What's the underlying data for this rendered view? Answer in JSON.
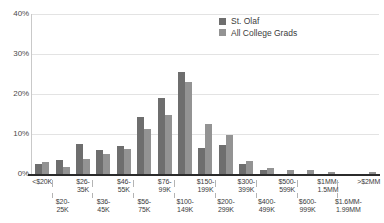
{
  "chart_data": {
    "type": "bar",
    "title": "",
    "subtitle": "",
    "xlabel": "",
    "ylabel": "",
    "ylim": [
      0,
      40
    ],
    "yunit": "%",
    "grid": true,
    "legend_position": "top-right",
    "ytick_labels": [
      "40%",
      "30%",
      "20%",
      "10%",
      "0%"
    ],
    "ytick_values": [
      40,
      30,
      20,
      10,
      0
    ],
    "categories": [
      "<$20K",
      "$20-\n25K",
      "$26-\n35K",
      "$36-\n45K",
      "$46-\n55K",
      "$56-\n75K",
      "$76-\n99K",
      "$100-\n149K",
      "$150-\n199K",
      "$200-\n299K",
      "$300-\n399K",
      "$400-\n499K",
      "$500-\n599K",
      "$600-\n999K",
      "$1MM-\n1.5MM",
      "$1.6MM-\n1.99MM",
      ">$2MM"
    ],
    "series": [
      {
        "name": "St. Olaf",
        "color": "#6e6e6e",
        "values": [
          2.5,
          3.4,
          7.5,
          6.1,
          7.0,
          14.2,
          19.1,
          25.6,
          6.4,
          7.2,
          2.4,
          1.1,
          0.0,
          0.0,
          0.0,
          0.0,
          0.0
        ]
      },
      {
        "name": "All College Grads",
        "color": "#939393",
        "values": [
          3.0,
          1.8,
          3.8,
          5.1,
          6.2,
          11.3,
          14.8,
          23.1,
          12.5,
          9.8,
          3.2,
          1.5,
          1.1,
          1.1,
          0.6,
          0.0,
          0.6
        ]
      }
    ]
  },
  "legend": {
    "items": [
      {
        "label": "St. Olaf",
        "color": "#6e6e6e"
      },
      {
        "label": "All College Grads",
        "color": "#939393"
      }
    ]
  },
  "axis": {
    "y_ticks": [
      {
        "label": "40%",
        "value": 40
      },
      {
        "label": "30%",
        "value": 30
      },
      {
        "label": "20%",
        "value": 20
      },
      {
        "label": "10%",
        "value": 10
      },
      {
        "label": "0%",
        "value": 0
      }
    ],
    "x_labels_top": [
      "<$20K",
      "$26-\n35K",
      "$46-\n55K",
      "$76-\n99K",
      "$150-\n199K",
      "$300-\n399K",
      "$500-\n599K",
      "$1MM-\n1.5MM",
      ">$2MM"
    ],
    "x_labels_bottom": [
      "$20-\n25K",
      "$36-\n45K",
      "$56-\n75K",
      "$100-\n149K",
      "$200-\n299K",
      "$400-\n499K",
      "$600-\n999K",
      "$1.6MM-\n1.99MM"
    ]
  },
  "colors": {
    "series_primary": "#6e6e6e",
    "series_secondary": "#939393",
    "gridline": "#e3e3e3",
    "axis": "#2b2b2b",
    "text": "#3c3c3c",
    "background": "#ffffff"
  }
}
